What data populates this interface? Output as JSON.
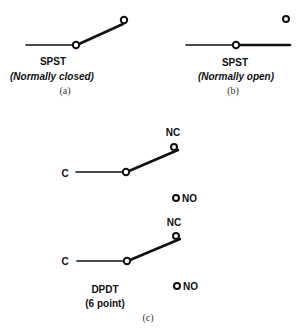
{
  "diagram": {
    "panel_a": {
      "type": "SPST",
      "state": "(Normally closed)",
      "caption": "(a)"
    },
    "panel_b": {
      "type": "SPST",
      "state": "(Normally open)",
      "caption": "(b)"
    },
    "panel_c": {
      "upper": {
        "common_label": "C",
        "nc_label": "NC",
        "no_label": "NO"
      },
      "lower": {
        "common_label": "C",
        "nc_label": "NC",
        "no_label": "NO"
      },
      "type": "DPDT",
      "note": "(6 point)",
      "caption": "(c)"
    }
  }
}
